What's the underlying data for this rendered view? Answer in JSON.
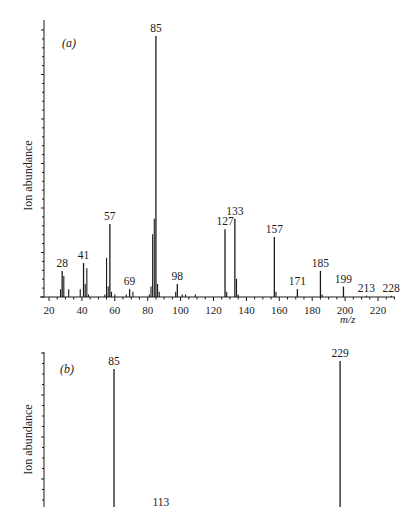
{
  "chart_data": [
    {
      "type": "bar",
      "panel_label": "(a)",
      "title": "",
      "xlabel": "m/z",
      "ylabel": "Ion abundance",
      "xlim": [
        15,
        235
      ],
      "ylim": [
        0,
        100
      ],
      "xticks": [
        20,
        40,
        60,
        80,
        100,
        120,
        140,
        160,
        180,
        200,
        220
      ],
      "grid": false,
      "labeled_peaks": [
        {
          "mz": 28,
          "abundance": 10,
          "label": "28"
        },
        {
          "mz": 41,
          "abundance": 13,
          "label": "41"
        },
        {
          "mz": 57,
          "abundance": 28,
          "label": "57"
        },
        {
          "mz": 69,
          "abundance": 3,
          "label": "69"
        },
        {
          "mz": 85,
          "abundance": 100,
          "label": "85"
        },
        {
          "mz": 98,
          "abundance": 5,
          "label": "98"
        },
        {
          "mz": 127,
          "abundance": 26,
          "label": "127"
        },
        {
          "mz": 133,
          "abundance": 30,
          "label": "133"
        },
        {
          "mz": 157,
          "abundance": 23,
          "label": "157"
        },
        {
          "mz": 171,
          "abundance": 3,
          "label": "171"
        },
        {
          "mz": 185,
          "abundance": 10,
          "label": "185"
        },
        {
          "mz": 199,
          "abundance": 4,
          "label": "199"
        },
        {
          "mz": 213,
          "abundance": 0.5,
          "label": "213"
        },
        {
          "mz": 228,
          "abundance": 0.5,
          "label": "228"
        }
      ],
      "minor_peaks": [
        {
          "mz": 27,
          "abundance": 3
        },
        {
          "mz": 29,
          "abundance": 8
        },
        {
          "mz": 32,
          "abundance": 3
        },
        {
          "mz": 39,
          "abundance": 3
        },
        {
          "mz": 42,
          "abundance": 5
        },
        {
          "mz": 43,
          "abundance": 11
        },
        {
          "mz": 44,
          "abundance": 1
        },
        {
          "mz": 54,
          "abundance": 1
        },
        {
          "mz": 55,
          "abundance": 15
        },
        {
          "mz": 56,
          "abundance": 4
        },
        {
          "mz": 58,
          "abundance": 2
        },
        {
          "mz": 60,
          "abundance": 1
        },
        {
          "mz": 67,
          "abundance": 1
        },
        {
          "mz": 71,
          "abundance": 2
        },
        {
          "mz": 81,
          "abundance": 1
        },
        {
          "mz": 82,
          "abundance": 4
        },
        {
          "mz": 83,
          "abundance": 24
        },
        {
          "mz": 84,
          "abundance": 30
        },
        {
          "mz": 86,
          "abundance": 5
        },
        {
          "mz": 87,
          "abundance": 2
        },
        {
          "mz": 97,
          "abundance": 2
        },
        {
          "mz": 101,
          "abundance": 1
        },
        {
          "mz": 103,
          "abundance": 1
        },
        {
          "mz": 109,
          "abundance": 1
        },
        {
          "mz": 128,
          "abundance": 2
        },
        {
          "mz": 134,
          "abundance": 7
        },
        {
          "mz": 135,
          "abundance": 1
        },
        {
          "mz": 158,
          "abundance": 2
        },
        {
          "mz": 186,
          "abundance": 1
        }
      ]
    },
    {
      "type": "bar",
      "panel_label": "(b)",
      "title": "",
      "xlabel": "",
      "ylabel": "Ion abundance",
      "ylim": [
        0,
        100
      ],
      "grid": false,
      "note": "panel cropped at bottom of image; baseline not visible",
      "labeled_peaks": [
        {
          "mz": 85,
          "abundance": 97,
          "label": "85"
        },
        {
          "mz": 113,
          "abundance": 3,
          "label": "113"
        },
        {
          "mz": 229,
          "abundance": 100,
          "label": "229"
        }
      ]
    }
  ],
  "labels": {
    "panel_a": "(a)",
    "panel_b": "(b)",
    "ylabel_a": "Ion abundance",
    "ylabel_b": "Ion abundance",
    "xunit_a": "m/z"
  }
}
